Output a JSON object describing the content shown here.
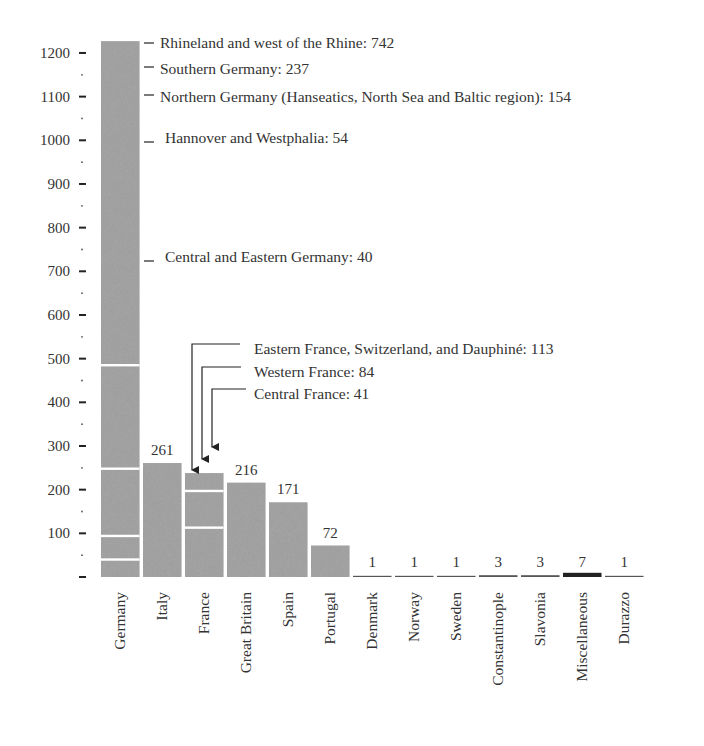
{
  "chart_data": {
    "type": "bar",
    "title": "",
    "xlabel": "",
    "ylabel": "",
    "ylim": [
      0,
      1230
    ],
    "grid": false,
    "y_ticks": [
      0,
      100,
      200,
      300,
      400,
      500,
      600,
      700,
      800,
      900,
      1000,
      1100,
      1200
    ],
    "y_tick_labels": [
      "",
      "100",
      "200",
      "300",
      "400",
      "500",
      "600",
      "700",
      "800",
      "900",
      "1000",
      "1100",
      "1200"
    ],
    "categories": [
      "Germany",
      "Italy",
      "France",
      "Great Britain",
      "Spain",
      "Portugal",
      "Denmark",
      "Norway",
      "Sweden",
      "Constantinople",
      "Slavonia",
      "Miscellaneous",
      "Durazzo"
    ],
    "values": [
      1227,
      261,
      238,
      216,
      171,
      72,
      1,
      1,
      1,
      3,
      3,
      7,
      1
    ],
    "value_labels": [
      "",
      "261",
      "",
      "216",
      "171",
      "72",
      "1",
      "1",
      "1",
      "3",
      "3",
      "7",
      "1"
    ],
    "stacked_segments": {
      "Germany": [
        {
          "name": "Central and Eastern Germany",
          "value": 40
        },
        {
          "name": "Hannover and Westphalia",
          "value": 54
        },
        {
          "name": "Northern Germany (Hanseatics, North Sea and Baltic region)",
          "value": 154
        },
        {
          "name": "Southern Germany",
          "value": 237
        },
        {
          "name": "Rhineland and west of the Rhine",
          "value": 742
        }
      ],
      "France": [
        {
          "name": "Eastern France, Switzerland, and Dauphiné",
          "value": 113
        },
        {
          "name": "Western France",
          "value": 84
        },
        {
          "name": "Central France",
          "value": 41
        }
      ]
    },
    "annotations": {
      "germany": [
        "Rhineland and west of the Rhine: 742",
        "Southern Germany: 237",
        "Northern Germany (Hanseatics, North Sea and Baltic region): 154",
        "Hannover and Westphalia: 54",
        "Central and Eastern Germany: 40"
      ],
      "france": [
        "Eastern France, Switzerland, and Dauphiné: 113",
        "Western France: 84",
        "Central France: 41"
      ]
    }
  },
  "colors": {
    "bar": "#9a9a9a",
    "text": "#333333",
    "background": "#ffffff"
  }
}
